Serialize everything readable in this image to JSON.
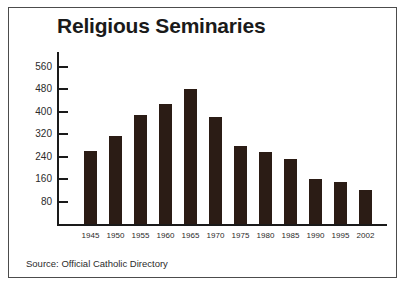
{
  "frame": {
    "border_color": "#4c4c4c",
    "background": "#ffffff"
  },
  "chart_data": {
    "type": "bar",
    "title": "Religious Seminaries",
    "xlabel": "",
    "ylabel": "",
    "categories": [
      "1945",
      "1950",
      "1955",
      "1960",
      "1965",
      "1970",
      "1975",
      "1980",
      "1985",
      "1990",
      "1995",
      "2002"
    ],
    "values": [
      258,
      313,
      389,
      428,
      480,
      382,
      276,
      255,
      232,
      161,
      148,
      122
    ],
    "ylim": [
      0,
      600
    ],
    "yticks": [
      80,
      160,
      240,
      320,
      400,
      480,
      560
    ],
    "ytick_labels": [
      "80",
      "160",
      "240",
      "320",
      "400",
      "480",
      "560"
    ],
    "grid": false,
    "legend": null,
    "bar_color": "#2b1c15",
    "axis_color": "#1a1a1a",
    "source": "Source: Official Catholic Directory"
  }
}
